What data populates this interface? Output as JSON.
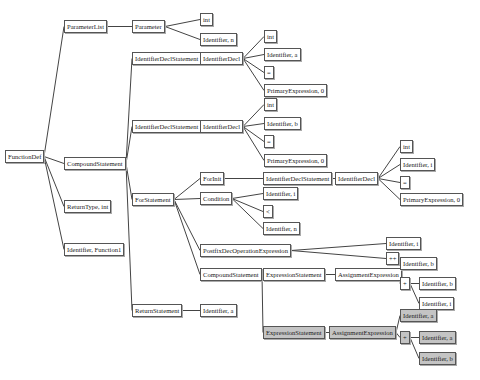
{
  "colors": {
    "edge": "#444444",
    "border": "#555555",
    "node_bg": "#ffffff",
    "highlight_bg": "#c4c4c4"
  },
  "nodes": [
    {
      "id": "fd",
      "label": "FunctionDef",
      "x": 5,
      "y": 150,
      "hl": false
    },
    {
      "id": "pl",
      "label": "ParameterList",
      "x": 64,
      "y": 20,
      "hl": false
    },
    {
      "id": "cs",
      "label": "CompoundStatement",
      "x": 64,
      "y": 157,
      "hl": false
    },
    {
      "id": "rt",
      "label": "ReturnType, int",
      "x": 64,
      "y": 200,
      "hl": false
    },
    {
      "id": "idf",
      "label": "Identifier, Function1",
      "x": 64,
      "y": 243,
      "hl": false
    },
    {
      "id": "par",
      "label": "Parameter",
      "x": 132,
      "y": 20,
      "hl": false
    },
    {
      "id": "pint",
      "label": "int",
      "x": 200,
      "y": 13,
      "hl": false
    },
    {
      "id": "pn",
      "label": "Identifier, n",
      "x": 200,
      "y": 33,
      "hl": false
    },
    {
      "id": "ids1",
      "label": "IdentifierDeclStatement",
      "x": 132,
      "y": 52,
      "hl": false
    },
    {
      "id": "idd1",
      "label": "IdentifierDecl",
      "x": 200,
      "y": 52,
      "hl": false
    },
    {
      "id": "d1int",
      "label": "int",
      "x": 264,
      "y": 30,
      "hl": false
    },
    {
      "id": "d1a",
      "label": "Identifier, a",
      "x": 264,
      "y": 48,
      "hl": false
    },
    {
      "id": "d1eq",
      "label": "=",
      "x": 264,
      "y": 66,
      "hl": false
    },
    {
      "id": "d1p",
      "label": "PrimaryExpression, 0",
      "x": 264,
      "y": 84,
      "hl": false
    },
    {
      "id": "ids2",
      "label": "IdentifierDeclStatement",
      "x": 132,
      "y": 120,
      "hl": false
    },
    {
      "id": "idd2",
      "label": "IdentifierDecl",
      "x": 200,
      "y": 120,
      "hl": false
    },
    {
      "id": "d2int",
      "label": "int",
      "x": 264,
      "y": 98,
      "hl": false
    },
    {
      "id": "d2b",
      "label": "Identifier, b",
      "x": 264,
      "y": 117,
      "hl": false
    },
    {
      "id": "d2eq",
      "label": "=",
      "x": 264,
      "y": 135,
      "hl": false
    },
    {
      "id": "d2p",
      "label": "PrimaryExpression, 0",
      "x": 264,
      "y": 154,
      "hl": false
    },
    {
      "id": "fs",
      "label": "ForStatement",
      "x": 132,
      "y": 193,
      "hl": false
    },
    {
      "id": "fi",
      "label": "ForInit",
      "x": 200,
      "y": 172,
      "hl": false
    },
    {
      "id": "ids3",
      "label": "IdentifierDeclStatement",
      "x": 263,
      "y": 172,
      "hl": false
    },
    {
      "id": "idd3",
      "label": "IdentifierDecl",
      "x": 335,
      "y": 172,
      "hl": false
    },
    {
      "id": "d3int",
      "label": "int",
      "x": 400,
      "y": 140,
      "hl": false
    },
    {
      "id": "d3i",
      "label": "Identifier, i",
      "x": 400,
      "y": 158,
      "hl": false
    },
    {
      "id": "d3eq",
      "label": "=",
      "x": 400,
      "y": 176,
      "hl": false
    },
    {
      "id": "d3p",
      "label": "PrimaryExpression, 0",
      "x": 400,
      "y": 193,
      "hl": false
    },
    {
      "id": "cond",
      "label": "Condition",
      "x": 200,
      "y": 192,
      "hl": false
    },
    {
      "id": "ci",
      "label": "Identifier, i",
      "x": 263,
      "y": 187,
      "hl": false
    },
    {
      "id": "clt",
      "label": "<",
      "x": 263,
      "y": 205,
      "hl": false
    },
    {
      "id": "cn",
      "label": "Identifier, n",
      "x": 263,
      "y": 222,
      "hl": false
    },
    {
      "id": "pdo",
      "label": "PostfixDecOperationExpression",
      "x": 200,
      "y": 244,
      "hl": false
    },
    {
      "id": "pdi",
      "label": "Identifier, i",
      "x": 386,
      "y": 237,
      "hl": false
    },
    {
      "id": "pdpp",
      "label": "++",
      "x": 386,
      "y": 252,
      "hl": false
    },
    {
      "id": "cs2",
      "label": "CompoundStatement",
      "x": 200,
      "y": 268,
      "hl": false
    },
    {
      "id": "es1",
      "label": "ExpressionStatement",
      "x": 263,
      "y": 268,
      "hl": false
    },
    {
      "id": "ae1",
      "label": "AssignmentExpression",
      "x": 335,
      "y": 268,
      "hl": false
    },
    {
      "id": "a1b",
      "label": "Identifier, b",
      "x": 400,
      "y": 257,
      "hl": false
    },
    {
      "id": "a1plus",
      "label": "+",
      "x": 400,
      "y": 277,
      "hl": false
    },
    {
      "id": "a1b2",
      "label": "Identifier, b",
      "x": 419,
      "y": 277,
      "hl": false
    },
    {
      "id": "a1i",
      "label": "Identifier, i",
      "x": 419,
      "y": 297,
      "hl": false
    },
    {
      "id": "rs",
      "label": "ReturnStatement",
      "x": 132,
      "y": 304,
      "hl": false
    },
    {
      "id": "ra",
      "label": "Identifier, a",
      "x": 200,
      "y": 304,
      "hl": false
    },
    {
      "id": "es2",
      "label": "ExpressionStatement",
      "x": 263,
      "y": 326,
      "hl": true
    },
    {
      "id": "ae2",
      "label": "AssignmentExpression",
      "x": 329,
      "y": 326,
      "hl": true
    },
    {
      "id": "a2a",
      "label": "Identifier, a",
      "x": 400,
      "y": 309,
      "hl": true
    },
    {
      "id": "a2plus",
      "label": "+",
      "x": 400,
      "y": 331,
      "hl": true
    },
    {
      "id": "a2a2",
      "label": "Identifier, a",
      "x": 419,
      "y": 331,
      "hl": true
    },
    {
      "id": "a2b",
      "label": "Identifier, b",
      "x": 419,
      "y": 352,
      "hl": true
    }
  ],
  "edges": [
    [
      "fd",
      "pl"
    ],
    [
      "fd",
      "cs"
    ],
    [
      "fd",
      "rt"
    ],
    [
      "fd",
      "idf"
    ],
    [
      "pl",
      "par"
    ],
    [
      "par",
      "pint"
    ],
    [
      "par",
      "pn"
    ],
    [
      "cs",
      "ids1"
    ],
    [
      "cs",
      "ids2"
    ],
    [
      "cs",
      "fs"
    ],
    [
      "cs",
      "rs"
    ],
    [
      "ids1",
      "idd1"
    ],
    [
      "idd1",
      "d1int"
    ],
    [
      "idd1",
      "d1a"
    ],
    [
      "idd1",
      "d1eq"
    ],
    [
      "idd1",
      "d1p"
    ],
    [
      "ids2",
      "idd2"
    ],
    [
      "idd2",
      "d2int"
    ],
    [
      "idd2",
      "d2b"
    ],
    [
      "idd2",
      "d2eq"
    ],
    [
      "idd2",
      "d2p"
    ],
    [
      "fs",
      "fi"
    ],
    [
      "fs",
      "cond"
    ],
    [
      "fs",
      "pdo"
    ],
    [
      "fs",
      "cs2"
    ],
    [
      "fi",
      "ids3"
    ],
    [
      "ids3",
      "idd3"
    ],
    [
      "idd3",
      "d3int"
    ],
    [
      "idd3",
      "d3i"
    ],
    [
      "idd3",
      "d3eq"
    ],
    [
      "idd3",
      "d3p"
    ],
    [
      "cond",
      "ci"
    ],
    [
      "cond",
      "clt"
    ],
    [
      "cond",
      "cn"
    ],
    [
      "pdo",
      "pdi"
    ],
    [
      "pdo",
      "pdpp"
    ],
    [
      "cs2",
      "es1"
    ],
    [
      "cs2",
      "es2"
    ],
    [
      "es1",
      "ae1"
    ],
    [
      "ae1",
      "a1b"
    ],
    [
      "ae1",
      "a1plus"
    ],
    [
      "a1plus",
      "a1b2"
    ],
    [
      "a1plus",
      "a1i"
    ],
    [
      "rs",
      "ra"
    ],
    [
      "es2",
      "ae2"
    ],
    [
      "ae2",
      "a2a"
    ],
    [
      "ae2",
      "a2plus"
    ],
    [
      "a2plus",
      "a2a2"
    ],
    [
      "a2plus",
      "a2b"
    ]
  ]
}
